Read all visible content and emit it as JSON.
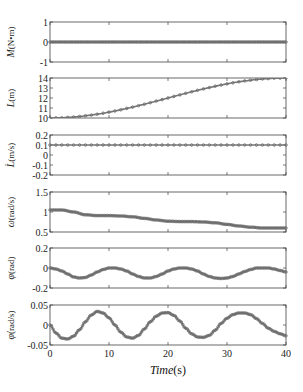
{
  "chart_data": {
    "type": "line",
    "layout": "6 vertically stacked subplots sharing x-axis",
    "x": {
      "label_italic": "Time",
      "label_unit": "(s)",
      "ticks": [
        0,
        10,
        20,
        30,
        40
      ],
      "range": [
        0,
        40
      ]
    },
    "grid": false,
    "marker": "circle",
    "line_color": "#777777",
    "subplots": [
      {
        "id": "M",
        "ylabel_italic": "M",
        "ylabel_unit": "(N•m)",
        "ylim": [
          -1,
          1
        ],
        "yticks": [
          -1,
          0,
          1
        ],
        "ytick_labels": [
          "-1",
          "0",
          "1"
        ],
        "description": "constant at 0",
        "points": [
          [
            0,
            0
          ],
          [
            40,
            0
          ]
        ]
      },
      {
        "id": "L",
        "ylabel_italic": "L",
        "ylabel_unit": "(m)",
        "ylim": [
          10,
          14
        ],
        "yticks": [
          10,
          11,
          12,
          13,
          14
        ],
        "ytick_labels": [
          "10",
          "11",
          "12",
          "13",
          "14"
        ],
        "description": "linear increase from 10 to 14",
        "points": [
          [
            0,
            10
          ],
          [
            40,
            14
          ]
        ]
      },
      {
        "id": "Ldot",
        "ylabel_italic": "L̇",
        "ylabel_unit": "(m/s)",
        "ylim": [
          -0.2,
          0.2
        ],
        "yticks": [
          -0.2,
          -0.1,
          0,
          0.1,
          0.2
        ],
        "ytick_labels": [
          "-0.2",
          "-0.1",
          "0",
          "0.1",
          "0.2"
        ],
        "description": "constant at 0.1",
        "points": [
          [
            0,
            0.1
          ],
          [
            40,
            0.1
          ]
        ]
      },
      {
        "id": "omega",
        "ylabel_italic": "ω",
        "ylabel_unit": "(rad/s)",
        "ylim": [
          0.5,
          1.5
        ],
        "yticks": [
          0.5,
          1,
          1.5
        ],
        "ytick_labels": [
          "0.5",
          "1",
          "1.5"
        ],
        "description": "stepwise slow decrease from ~1.05 to ~0.6",
        "points": [
          [
            0,
            1.05
          ],
          [
            2,
            1.05
          ],
          [
            4,
            1.0
          ],
          [
            6,
            0.93
          ],
          [
            8,
            0.91
          ],
          [
            10,
            0.91
          ],
          [
            12,
            0.9
          ],
          [
            14,
            0.88
          ],
          [
            16,
            0.84
          ],
          [
            18,
            0.8
          ],
          [
            20,
            0.77
          ],
          [
            22,
            0.76
          ],
          [
            24,
            0.76
          ],
          [
            26,
            0.75
          ],
          [
            28,
            0.73
          ],
          [
            30,
            0.69
          ],
          [
            32,
            0.65
          ],
          [
            34,
            0.62
          ],
          [
            36,
            0.6
          ],
          [
            38,
            0.6
          ],
          [
            40,
            0.6
          ]
        ]
      },
      {
        "id": "phi",
        "ylabel_italic": "φ",
        "ylabel_unit": "(rad)",
        "ylim": [
          -0.2,
          0.2
        ],
        "yticks": [
          -0.2,
          0,
          0.2
        ],
        "ytick_labels": [
          "-0.2",
          "0",
          "0.2"
        ],
        "description": "oscillation between ~-0.1 and ~0, period ~12s",
        "points": [
          [
            0,
            0.0
          ],
          [
            1,
            -0.01
          ],
          [
            2,
            -0.03
          ],
          [
            3,
            -0.06
          ],
          [
            4,
            -0.09
          ],
          [
            5,
            -0.1
          ],
          [
            6,
            -0.095
          ],
          [
            7,
            -0.07
          ],
          [
            8,
            -0.04
          ],
          [
            9,
            -0.015
          ],
          [
            10,
            0.0
          ],
          [
            11,
            0.0
          ],
          [
            12,
            -0.01
          ],
          [
            13,
            -0.03
          ],
          [
            14,
            -0.06
          ],
          [
            15,
            -0.085
          ],
          [
            16,
            -0.1
          ],
          [
            17,
            -0.1
          ],
          [
            18,
            -0.085
          ],
          [
            19,
            -0.06
          ],
          [
            20,
            -0.03
          ],
          [
            21,
            -0.01
          ],
          [
            22,
            0.0
          ],
          [
            23,
            0.0
          ],
          [
            24,
            -0.01
          ],
          [
            25,
            -0.03
          ],
          [
            26,
            -0.06
          ],
          [
            27,
            -0.085
          ],
          [
            28,
            -0.1
          ],
          [
            29,
            -0.105
          ],
          [
            30,
            -0.1
          ],
          [
            31,
            -0.085
          ],
          [
            32,
            -0.06
          ],
          [
            33,
            -0.035
          ],
          [
            34,
            -0.015
          ],
          [
            35,
            0.0
          ],
          [
            36,
            0.0
          ],
          [
            37,
            0.0
          ],
          [
            38,
            -0.01
          ],
          [
            39,
            -0.025
          ],
          [
            40,
            -0.04
          ]
        ]
      },
      {
        "id": "phidot",
        "ylabel_italic": "φ̇",
        "ylabel_unit": "(rad/s)",
        "ylim": [
          -0.05,
          0.05
        ],
        "yticks": [
          -0.05,
          0,
          0.05
        ],
        "ytick_labels": [
          "-0.05",
          "0",
          "0.05"
        ],
        "description": "oscillation with amplitude ~0.035, period ~12s",
        "points": [
          [
            0,
            0.0
          ],
          [
            1,
            -0.02
          ],
          [
            2,
            -0.033
          ],
          [
            3,
            -0.035
          ],
          [
            4,
            -0.028
          ],
          [
            5,
            -0.012
          ],
          [
            6,
            0.008
          ],
          [
            7,
            0.025
          ],
          [
            8,
            0.034
          ],
          [
            9,
            0.03
          ],
          [
            10,
            0.018
          ],
          [
            11,
            0.0
          ],
          [
            12,
            -0.018
          ],
          [
            13,
            -0.03
          ],
          [
            14,
            -0.033
          ],
          [
            15,
            -0.026
          ],
          [
            16,
            -0.01
          ],
          [
            17,
            0.008
          ],
          [
            18,
            0.022
          ],
          [
            19,
            0.03
          ],
          [
            20,
            0.031
          ],
          [
            21,
            0.024
          ],
          [
            22,
            0.01
          ],
          [
            23,
            -0.008
          ],
          [
            24,
            -0.022
          ],
          [
            25,
            -0.03
          ],
          [
            26,
            -0.031
          ],
          [
            27,
            -0.026
          ],
          [
            28,
            -0.013
          ],
          [
            29,
            0.004
          ],
          [
            30,
            0.017
          ],
          [
            31,
            0.026
          ],
          [
            32,
            0.03
          ],
          [
            33,
            0.03
          ],
          [
            34,
            0.026
          ],
          [
            35,
            0.016
          ],
          [
            36,
            0.004
          ],
          [
            37,
            -0.008
          ],
          [
            38,
            -0.016
          ],
          [
            39,
            -0.022
          ],
          [
            40,
            -0.027
          ]
        ]
      }
    ]
  },
  "layout_px": {
    "plot_left": 50,
    "plot_right": 286,
    "panels_top": [
      22,
      78,
      135,
      192,
      248,
      305
    ],
    "panel_height": 40,
    "xtick_label_y": 357,
    "xtitle_y": 374
  }
}
